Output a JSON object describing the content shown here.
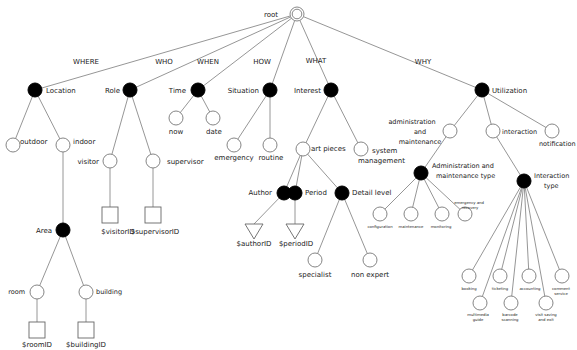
{
  "diagram": {
    "title": "root",
    "edge_labels": [
      {
        "id": "where",
        "text": "WHERE",
        "x": 86,
        "y": 64
      },
      {
        "id": "who",
        "text": "WHO",
        "x": 164,
        "y": 64
      },
      {
        "id": "when",
        "text": "WHEN",
        "x": 208,
        "y": 64
      },
      {
        "id": "how",
        "text": "HOW",
        "x": 262,
        "y": 64
      },
      {
        "id": "what",
        "text": "WHAT",
        "x": 316,
        "y": 63
      },
      {
        "id": "why",
        "text": "WHY",
        "x": 423,
        "y": 64
      }
    ],
    "nodes": [
      {
        "id": "root",
        "type": "root",
        "x": 297,
        "y": 14,
        "r": 7,
        "label": "root",
        "lx": 278,
        "ly": 17,
        "anchor": "end",
        "fs": 7
      },
      {
        "id": "location",
        "type": "filled",
        "x": 35,
        "y": 90,
        "r": 7,
        "label": "Location",
        "lx": 46,
        "ly": 93,
        "anchor": "start",
        "fs": 7
      },
      {
        "id": "role",
        "type": "filled",
        "x": 130,
        "y": 90,
        "r": 7,
        "label": "Role",
        "lx": 120,
        "ly": 93,
        "anchor": "end",
        "fs": 7
      },
      {
        "id": "time",
        "type": "filled",
        "x": 198,
        "y": 90,
        "r": 7,
        "label": "Time",
        "lx": 186,
        "ly": 93,
        "anchor": "end",
        "fs": 7
      },
      {
        "id": "situation",
        "type": "filled",
        "x": 270,
        "y": 90,
        "r": 7,
        "label": "Situation",
        "lx": 259,
        "ly": 93,
        "anchor": "end",
        "fs": 7
      },
      {
        "id": "interest",
        "type": "filled",
        "x": 331,
        "y": 90,
        "r": 7,
        "label": "Interest",
        "lx": 321,
        "ly": 93,
        "anchor": "end",
        "fs": 7
      },
      {
        "id": "utilization",
        "type": "filled",
        "x": 482,
        "y": 90,
        "r": 7,
        "label": "Utilization",
        "lx": 492,
        "ly": 93,
        "anchor": "start",
        "fs": 7
      },
      {
        "id": "outdoor",
        "type": "open",
        "x": 13,
        "y": 145,
        "r": 7,
        "label": "outdoor",
        "lx": 20,
        "ly": 144,
        "anchor": "start",
        "fs": 7
      },
      {
        "id": "indoor",
        "type": "open",
        "x": 63,
        "y": 145,
        "r": 7,
        "label": "indoor",
        "lx": 73,
        "ly": 144,
        "anchor": "start",
        "fs": 7
      },
      {
        "id": "visitor",
        "type": "open",
        "x": 110,
        "y": 161,
        "r": 7,
        "label": "visitor",
        "lx": 99,
        "ly": 164,
        "anchor": "end",
        "fs": 7
      },
      {
        "id": "supervisor",
        "type": "open",
        "x": 153,
        "y": 161,
        "r": 7,
        "label": "supervisor",
        "lx": 167,
        "ly": 164,
        "anchor": "start",
        "fs": 7
      },
      {
        "id": "now",
        "type": "open",
        "x": 176,
        "y": 118,
        "r": 7,
        "label": "now",
        "lx": 176,
        "ly": 134,
        "anchor": "middle",
        "fs": 7
      },
      {
        "id": "date",
        "type": "open",
        "x": 213,
        "y": 118,
        "r": 7,
        "label": "date",
        "lx": 214,
        "ly": 134,
        "anchor": "middle",
        "fs": 7
      },
      {
        "id": "emergency",
        "type": "open",
        "x": 234,
        "y": 145,
        "r": 7,
        "label": "emergency",
        "lx": 234,
        "ly": 160,
        "anchor": "middle",
        "fs": 7
      },
      {
        "id": "routine",
        "type": "open",
        "x": 270,
        "y": 145,
        "r": 7,
        "label": "routine",
        "lx": 271,
        "ly": 160,
        "anchor": "middle",
        "fs": 7
      },
      {
        "id": "art_pieces",
        "type": "open",
        "x": 303,
        "y": 149,
        "r": 7,
        "label": "art pieces",
        "lx": 311,
        "ly": 151,
        "anchor": "start",
        "fs": 7
      },
      {
        "id": "system_management",
        "type": "open",
        "x": 361,
        "y": 149,
        "r": 7,
        "label": "system",
        "lx": 372,
        "ly": 153,
        "anchor": "start",
        "fs": 7,
        "label2": "management",
        "l2x": 358,
        "l2y": 163
      },
      {
        "id": "admin_maint",
        "type": "open",
        "x": 450,
        "y": 131,
        "r": 7,
        "label": "administration",
        "lx": 412,
        "ly": 124,
        "anchor": "middle",
        "fs": 6.5,
        "label2": "and",
        "l2x": 420,
        "l2y": 134,
        "label3": "maintenance",
        "l3x": 420,
        "l3y": 144
      },
      {
        "id": "interaction",
        "type": "open",
        "x": 493,
        "y": 131,
        "r": 7,
        "label": "interaction",
        "lx": 502,
        "ly": 134,
        "anchor": "start",
        "fs": 6.5
      },
      {
        "id": "notification",
        "type": "open",
        "x": 552,
        "y": 131,
        "r": 7,
        "label": "notification",
        "lx": 539,
        "ly": 146,
        "anchor": "start",
        "fs": 6.5
      },
      {
        "id": "author",
        "type": "filled",
        "x": 284,
        "y": 193,
        "r": 7,
        "label": "Author",
        "lx": 272,
        "ly": 195,
        "anchor": "end",
        "fs": 7
      },
      {
        "id": "period",
        "type": "filled",
        "x": 295,
        "y": 193,
        "r": 7,
        "label": "Period",
        "lx": 305,
        "ly": 195,
        "anchor": "start",
        "fs": 7
      },
      {
        "id": "detail_level",
        "type": "filled",
        "x": 342,
        "y": 193,
        "r": 7,
        "label": "Detail level",
        "lx": 352,
        "ly": 195,
        "anchor": "start",
        "fs": 7
      },
      {
        "id": "admin_maint_type",
        "type": "filled",
        "x": 421,
        "y": 173,
        "r": 7,
        "label": "Administration and",
        "lx": 432,
        "ly": 168,
        "anchor": "start",
        "fs": 6.5,
        "label2": "maintenance type",
        "l2x": 436,
        "l2y": 178
      },
      {
        "id": "interaction_type",
        "type": "filled",
        "x": 524,
        "y": 181,
        "r": 7,
        "label": "Interaction",
        "lx": 534,
        "ly": 178,
        "anchor": "start",
        "fs": 6.5,
        "label2": "type",
        "l2x": 544,
        "l2y": 188
      },
      {
        "id": "configuration",
        "type": "open",
        "x": 380,
        "y": 214,
        "r": 7,
        "label": "configuration",
        "lx": 380,
        "ly": 228,
        "anchor": "middle",
        "fs": 3.8
      },
      {
        "id": "maintenance",
        "type": "open",
        "x": 411,
        "y": 214,
        "r": 7,
        "label": "maintenance",
        "lx": 411,
        "ly": 228,
        "anchor": "middle",
        "fs": 3.8
      },
      {
        "id": "monitoring",
        "type": "open",
        "x": 442,
        "y": 214,
        "r": 7,
        "label": "monitoring",
        "lx": 441,
        "ly": 228,
        "anchor": "middle",
        "fs": 3.8
      },
      {
        "id": "emergency_recovery",
        "type": "open",
        "x": 465,
        "y": 214,
        "r": 7,
        "label": "emergency and",
        "lx": 469,
        "ly": 204,
        "anchor": "middle",
        "fs": 3.8,
        "label2": "recovery",
        "l2x": 470,
        "l2y": 209
      },
      {
        "id": "specialist",
        "type": "open",
        "x": 315,
        "y": 260,
        "r": 7,
        "label": "specialist",
        "lx": 315,
        "ly": 277,
        "anchor": "middle",
        "fs": 7
      },
      {
        "id": "non_expert",
        "type": "open",
        "x": 370,
        "y": 260,
        "r": 7,
        "label": "non expert",
        "lx": 370,
        "ly": 277,
        "anchor": "middle",
        "fs": 7
      },
      {
        "id": "booking",
        "type": "open",
        "x": 469,
        "y": 276,
        "r": 7,
        "label": "booking",
        "lx": 469,
        "ly": 290,
        "anchor": "middle",
        "fs": 3.8
      },
      {
        "id": "ticketing",
        "type": "open",
        "x": 500,
        "y": 276,
        "r": 7,
        "label": "ticketing",
        "lx": 500,
        "ly": 290,
        "anchor": "middle",
        "fs": 3.8
      },
      {
        "id": "accounting",
        "type": "open",
        "x": 529,
        "y": 276,
        "r": 7,
        "label": "accounting",
        "lx": 530,
        "ly": 290,
        "anchor": "middle",
        "fs": 3.8
      },
      {
        "id": "comment_service",
        "type": "open",
        "x": 562,
        "y": 276,
        "r": 7,
        "label": "comment",
        "lx": 561,
        "ly": 290,
        "anchor": "middle",
        "fs": 3.8,
        "label2": "service",
        "l2x": 561,
        "l2y": 295
      },
      {
        "id": "multimedia_guide",
        "type": "open",
        "x": 480,
        "y": 303,
        "r": 7,
        "label": "multimedia",
        "lx": 478,
        "ly": 316,
        "anchor": "middle",
        "fs": 3.8,
        "label2": "guide",
        "l2x": 478,
        "l2y": 321
      },
      {
        "id": "barcode_scanning",
        "type": "open",
        "x": 511,
        "y": 303,
        "r": 7,
        "label": "barcode",
        "lx": 510,
        "ly": 316,
        "anchor": "middle",
        "fs": 3.8,
        "label2": "scanning",
        "l2x": 510,
        "l2y": 321
      },
      {
        "id": "visit_saving_exit",
        "type": "open",
        "x": 546,
        "y": 303,
        "r": 7,
        "label": "visit saving",
        "lx": 546,
        "ly": 316,
        "anchor": "middle",
        "fs": 3.8,
        "label2": "and exit",
        "l2x": 546,
        "l2y": 321
      },
      {
        "id": "area",
        "type": "filled",
        "x": 63,
        "y": 230,
        "r": 7,
        "label": "Area",
        "lx": 52,
        "ly": 233,
        "anchor": "end",
        "fs": 7
      },
      {
        "id": "room",
        "type": "open",
        "x": 37,
        "y": 292,
        "r": 7,
        "label": "room",
        "lx": 25,
        "ly": 294,
        "anchor": "end",
        "fs": 6.5
      },
      {
        "id": "building",
        "type": "open",
        "x": 86,
        "y": 292,
        "r": 7,
        "label": "building",
        "lx": 96,
        "ly": 294,
        "anchor": "start",
        "fs": 6.5
      }
    ],
    "leaves": [
      {
        "id": "visitor_id",
        "shape": "square",
        "x": 110,
        "y": 215,
        "label": "$visitorID",
        "lx": 118,
        "ly": 234,
        "anchor": "middle"
      },
      {
        "id": "supervisor_id",
        "shape": "square",
        "x": 153,
        "y": 215,
        "label": "$supervisorID",
        "lx": 155,
        "ly": 234,
        "anchor": "middle"
      },
      {
        "id": "author_id",
        "shape": "triangle",
        "x": 254,
        "y": 232,
        "label": "$authorID",
        "lx": 254,
        "ly": 246,
        "anchor": "middle"
      },
      {
        "id": "period_id",
        "shape": "triangle",
        "x": 295,
        "y": 232,
        "label": "$periodID",
        "lx": 296,
        "ly": 246,
        "anchor": "middle"
      },
      {
        "id": "room_id",
        "shape": "square",
        "x": 37,
        "y": 330,
        "label": "$roomID",
        "lx": 37,
        "ly": 347,
        "anchor": "middle"
      },
      {
        "id": "building_id",
        "shape": "square",
        "x": 86,
        "y": 330,
        "label": "$buildingID",
        "lx": 86,
        "ly": 347,
        "anchor": "middle"
      }
    ],
    "edges": [
      [
        "root",
        "location"
      ],
      [
        "root",
        "role"
      ],
      [
        "root",
        "time"
      ],
      [
        "root",
        "situation"
      ],
      [
        "root",
        "interest"
      ],
      [
        "root",
        "utilization"
      ],
      [
        "location",
        "outdoor"
      ],
      [
        "location",
        "indoor"
      ],
      [
        "indoor",
        "area"
      ],
      [
        "area",
        "room"
      ],
      [
        "area",
        "building"
      ],
      [
        "role",
        "visitor"
      ],
      [
        "role",
        "supervisor"
      ],
      [
        "time",
        "now"
      ],
      [
        "time",
        "date"
      ],
      [
        "situation",
        "emergency"
      ],
      [
        "situation",
        "routine"
      ],
      [
        "interest",
        "art_pieces"
      ],
      [
        "interest",
        "system_management"
      ],
      [
        "art_pieces",
        "author"
      ],
      [
        "art_pieces",
        "period"
      ],
      [
        "art_pieces",
        "detail_level"
      ],
      [
        "detail_level",
        "specialist"
      ],
      [
        "detail_level",
        "non_expert"
      ],
      [
        "utilization",
        "admin_maint"
      ],
      [
        "utilization",
        "interaction"
      ],
      [
        "utilization",
        "notification"
      ],
      [
        "admin_maint",
        "admin_maint_type"
      ],
      [
        "admin_maint_type",
        "configuration"
      ],
      [
        "admin_maint_type",
        "maintenance"
      ],
      [
        "admin_maint_type",
        "monitoring"
      ],
      [
        "admin_maint_type",
        "emergency_recovery"
      ],
      [
        "interaction",
        "interaction_type"
      ],
      [
        "interaction_type",
        "booking"
      ],
      [
        "interaction_type",
        "ticketing"
      ],
      [
        "interaction_type",
        "accounting"
      ],
      [
        "interaction_type",
        "comment_service"
      ],
      [
        "interaction_type",
        "multimedia_guide"
      ],
      [
        "interaction_type",
        "barcode_scanning"
      ],
      [
        "interaction_type",
        "visit_saving_exit"
      ],
      [
        "visitor",
        "visitor_id"
      ],
      [
        "supervisor",
        "supervisor_id"
      ],
      [
        "author",
        "author_id"
      ],
      [
        "period",
        "period_id"
      ],
      [
        "room",
        "room_id"
      ],
      [
        "building",
        "building_id"
      ]
    ]
  }
}
